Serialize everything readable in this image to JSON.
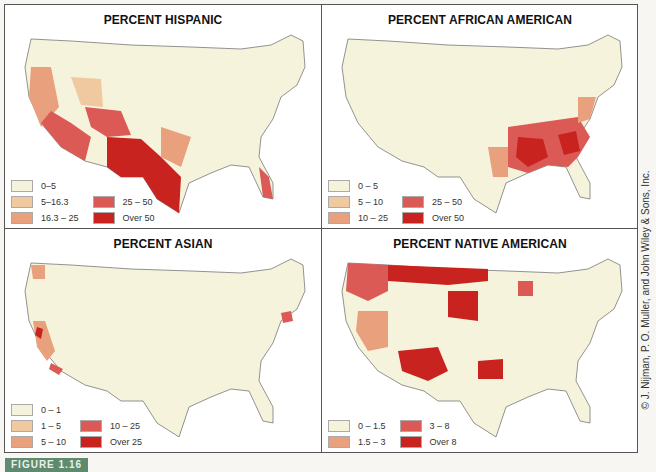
{
  "figure": {
    "label": "FIGURE 1.16",
    "credit": "© J. Nijman, P. O. Muller, and John Wiley & Sons, Inc."
  },
  "panels": [
    {
      "title": "PERCENT HISPANIC",
      "legend": [
        {
          "label": "0–5",
          "color": "#f6f3dc"
        },
        {
          "label": "5–16.3",
          "color": "#f0c9a0"
        },
        {
          "label": "16.3 – 25",
          "color": "#e9a07c"
        },
        {
          "label": "25 – 50",
          "color": "#dc5a55"
        },
        {
          "label": "Over 50",
          "color": "#c8231e"
        }
      ]
    },
    {
      "title": "PERCENT AFRICAN AMERICAN",
      "legend": [
        {
          "label": "0 – 5",
          "color": "#f6f3dc"
        },
        {
          "label": "5 – 10",
          "color": "#f0c9a0"
        },
        {
          "label": "10 – 25",
          "color": "#e9a07c"
        },
        {
          "label": "25 – 50",
          "color": "#dc5a55"
        },
        {
          "label": "Over 50",
          "color": "#c8231e"
        }
      ]
    },
    {
      "title": "PERCENT ASIAN",
      "legend": [
        {
          "label": "0 – 1",
          "color": "#f6f3dc"
        },
        {
          "label": "1 – 5",
          "color": "#f0c9a0"
        },
        {
          "label": "5 – 10",
          "color": "#e9a07c"
        },
        {
          "label": "10 – 25",
          "color": "#dc5a55"
        },
        {
          "label": "Over 25",
          "color": "#c8231e"
        }
      ]
    },
    {
      "title": "PERCENT NATIVE AMERICAN",
      "legend": [
        {
          "label": "0 – 1.5",
          "color": "#f6f3dc"
        },
        {
          "label": "1.5 – 3",
          "color": "#e9a07c"
        },
        {
          "label": "3 – 8",
          "color": "#dc5a55"
        },
        {
          "label": "Over 8",
          "color": "#c8231e"
        }
      ]
    }
  ]
}
